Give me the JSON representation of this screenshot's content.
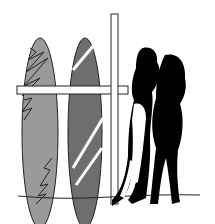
{
  "illustration": {
    "subject": "surfboards-and-couple",
    "cut_text": "",
    "colors": {
      "board_left": "#9a9a9a",
      "board_right": "#6e6e6e",
      "outline": "#222222",
      "silhouette": "#000000",
      "post": "#ffffff"
    }
  }
}
